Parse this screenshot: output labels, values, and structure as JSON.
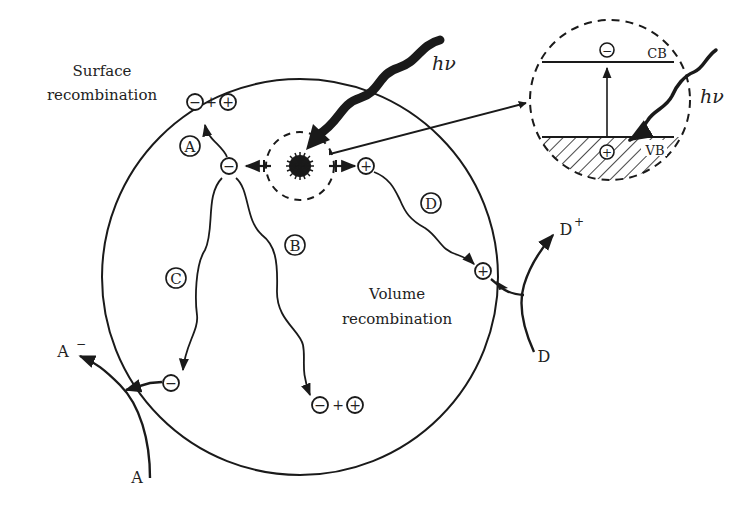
{
  "labels": {
    "surface_line1": "Surface",
    "surface_line2": "recombination",
    "volume_line1": "Volume",
    "volume_line2": "recombination",
    "hv_main": "hν",
    "hv_inset": "hν",
    "cb": "CB",
    "vb": "VB",
    "path_a": "A",
    "path_b": "B",
    "path_c": "C",
    "path_d": "D",
    "acceptor": "A",
    "acceptor_reduced": "A",
    "acceptor_reduced_sup": "−",
    "donor": "D",
    "donor_oxidized": "D",
    "donor_oxidized_sup": "+",
    "minus": "−",
    "plus": "+",
    "plus_sign": "+"
  },
  "colors": {
    "ink": "#1a1a1a",
    "background": "#ffffff"
  }
}
